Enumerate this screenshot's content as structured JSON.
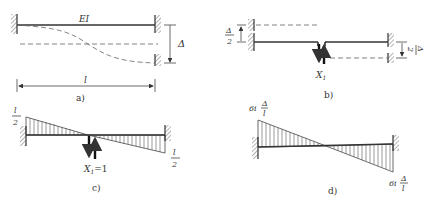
{
  "figure": {
    "panels": [
      {
        "id": "a",
        "caption": "a)",
        "beam_label": "EI",
        "length_label": "l",
        "settlement_label": "Δ"
      },
      {
        "id": "b",
        "caption": "b)",
        "left_settlement": {
          "num": "Δ",
          "den": "2"
        },
        "right_settlement": {
          "num": "Δ",
          "den": "2"
        },
        "unknown_label": "X",
        "unknown_sub": "1"
      },
      {
        "id": "c",
        "caption": "c)",
        "left_moment": {
          "num": "l",
          "den": "2"
        },
        "right_moment": {
          "num": "l",
          "den": "2"
        },
        "unit_load_label": "X",
        "unit_load_sub": "1",
        "unit_load_value": "=1"
      },
      {
        "id": "d",
        "caption": "d)",
        "left_moment": {
          "coef": "6i",
          "num": "Δ",
          "den": "l"
        },
        "right_moment": {
          "coef": "6i",
          "num": "Δ",
          "den": "l"
        }
      }
    ]
  }
}
